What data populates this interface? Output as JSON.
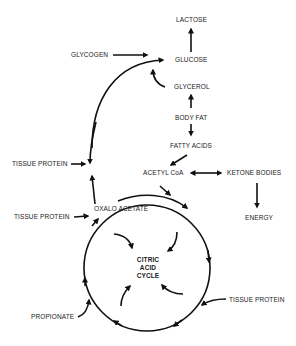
{
  "diagram": {
    "nodes": {
      "lactose": "LACTOSE",
      "glycogen": "GLYCOGEN",
      "glucose": "GLUCOSE",
      "glycerol": "GLYCEROL",
      "body_fat": "BODY FAT",
      "fatty_acids": "FATTY ACIDS",
      "tissue_protein_1": "TISSUE PROTEIN",
      "acetyl_coa": "ACETYL CoA",
      "ketone_bodies": "KETONE BODIES",
      "tissue_protein_2": "TISSUE PROTEIN",
      "oxalo_acetate": "OXALO ACETATE",
      "energy": "ENERGY",
      "citric_line1": "CITRIC",
      "citric_line2": "ACID",
      "citric_line3": "CYCLE",
      "tissue_protein_3": "TISSUE PROTEIN",
      "propionate": "PROPIONATE"
    },
    "edges": [
      {
        "from": "GLUCOSE",
        "to": "LACTOSE"
      },
      {
        "from": "GLYCOGEN",
        "to": "GLUCOSE"
      },
      {
        "from": "OXALO ACETATE",
        "to": "GLUCOSE"
      },
      {
        "from": "GLYCEROL",
        "to": "GLUCOSE"
      },
      {
        "from": "BODY FAT",
        "to": "GLYCEROL"
      },
      {
        "from": "BODY FAT",
        "to": "FATTY ACIDS"
      },
      {
        "from": "FATTY ACIDS",
        "to": "ACETYL CoA"
      },
      {
        "from": "ACETYL CoA",
        "to": "KETONE BODIES",
        "bidirectional": true
      },
      {
        "from": "KETONE BODIES",
        "to": "ENERGY"
      },
      {
        "from": "TISSUE PROTEIN",
        "to": "GLUCOSE pathway"
      },
      {
        "from": "TISSUE PROTEIN",
        "to": "OXALO ACETATE"
      },
      {
        "from": "ACETYL CoA",
        "to": "CITRIC ACID CYCLE"
      },
      {
        "from": "TISSUE PROTEIN",
        "to": "CITRIC ACID CYCLE"
      },
      {
        "from": "PROPIONATE",
        "to": "CITRIC ACID CYCLE"
      }
    ],
    "colors": {
      "line": "#111111",
      "text": "#222222",
      "background": "#ffffff"
    }
  }
}
